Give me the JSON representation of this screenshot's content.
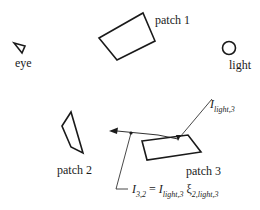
{
  "diagram": {
    "labels": {
      "eye": "eye",
      "light": "light",
      "patch1": "patch 1",
      "patch2": "patch 2",
      "patch3": "patch 3"
    },
    "annotations": {
      "incoming": {
        "symbol": "I",
        "subscript": "light,3"
      },
      "equation": {
        "lhs_symbol": "I",
        "lhs_subscript": "3,2",
        "equals": "=",
        "rhs_symbol": "I",
        "rhs_subscript": "light,3",
        "factor_symbol": "ξ",
        "factor_subscript": "2,light,3"
      }
    },
    "icons": {
      "eye": "eye-triangle-icon",
      "light": "light-circle-icon"
    },
    "colors": {
      "stroke": "#1a1a1a",
      "background": "#ffffff"
    }
  }
}
